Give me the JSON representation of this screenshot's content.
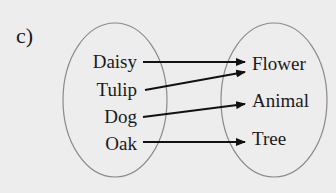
{
  "part_label": "c)",
  "domain_set": {
    "items": [
      "Daisy",
      "Tulip",
      "Dog",
      "Oak"
    ]
  },
  "codomain_set": {
    "items": [
      "Flower",
      "Animal",
      "Tree"
    ]
  },
  "mappings": [
    {
      "from": "Daisy",
      "to": "Flower"
    },
    {
      "from": "Tulip",
      "to": "Flower"
    },
    {
      "from": "Dog",
      "to": "Animal"
    },
    {
      "from": "Oak",
      "to": "Tree"
    }
  ],
  "colors": {
    "background": "#ededed",
    "ellipse_stroke": "#8a8a8a",
    "arrow": "#111111",
    "text": "#1a1a1a"
  }
}
